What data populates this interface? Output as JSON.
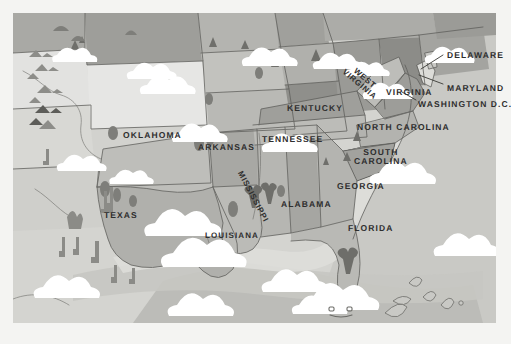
{
  "map": {
    "title": "Illustrated map of the Southeastern and South Central United States",
    "style": "grayscale flat illustration",
    "frame": {
      "x": 13,
      "y": 13,
      "width": 483,
      "height": 310
    },
    "colors": {
      "background": "#f4f4f2",
      "ocean": "#d9d9d6",
      "ocean_deep": "#c4c4c0",
      "shelf": "#cdcdc9",
      "land_light": "#e8e8e6",
      "land_mid": "#c3c3bf",
      "land_dark": "#9d9d99",
      "land_darker": "#8a8a86",
      "border": "#5e5e5a",
      "label": "#2e2e2e",
      "cloud": "#ffffff",
      "icon": "#7a7a76"
    },
    "state_labels": [
      {
        "name": "oklahoma",
        "text": "OKLAHOMA",
        "x": 123,
        "y": 131,
        "size": 8.5,
        "rotate": 0,
        "lines": [
          "OKLAHOMA"
        ]
      },
      {
        "name": "arkansas",
        "text": "ARKANSAS",
        "x": 198,
        "y": 143,
        "size": 8.5,
        "rotate": 0,
        "lines": [
          "ARKANSAS"
        ]
      },
      {
        "name": "texas",
        "text": "TEXAS",
        "x": 104,
        "y": 211,
        "size": 8.5,
        "rotate": 0,
        "lines": [
          "TEXAS"
        ]
      },
      {
        "name": "louisiana",
        "text": "LOUISIANA",
        "x": 205,
        "y": 232,
        "size": 8,
        "rotate": 0,
        "lines": [
          "LOUISIANA"
        ]
      },
      {
        "name": "mississippi",
        "text": "MISSISSIPPI",
        "x": 243,
        "y": 170,
        "size": 8,
        "rotate": 62,
        "lines": [
          "MISSISSIPPI"
        ]
      },
      {
        "name": "alabama",
        "text": "ALABAMA",
        "x": 281,
        "y": 200,
        "size": 8.5,
        "rotate": 0,
        "lines": [
          "ALABAMA"
        ]
      },
      {
        "name": "tennessee",
        "text": "TENNESSEE",
        "x": 262,
        "y": 135,
        "size": 8.5,
        "rotate": 0,
        "lines": [
          "TENNESSEE"
        ]
      },
      {
        "name": "kentucky",
        "text": "KENTUCKY",
        "x": 287,
        "y": 104,
        "size": 8.5,
        "rotate": 0,
        "lines": [
          "KENTUCKY"
        ]
      },
      {
        "name": "west-virginia",
        "text": "WEST VIRGINIA",
        "x": 351,
        "y": 62,
        "size": 8,
        "rotate": 40,
        "lines": [
          "WEST",
          "VIRGINIA"
        ]
      },
      {
        "name": "virginia",
        "text": "VIRGINIA",
        "x": 386,
        "y": 88,
        "size": 8.5,
        "rotate": 0,
        "lines": [
          "VIRGINIA"
        ]
      },
      {
        "name": "north-carolina",
        "text": "NORTH CAROLINA",
        "x": 357,
        "y": 123,
        "size": 8.5,
        "rotate": 0,
        "lines": [
          "NORTH CAROLINA"
        ]
      },
      {
        "name": "south-carolina",
        "text": "SOUTH CAROLINA",
        "x": 354,
        "y": 148,
        "size": 8.5,
        "rotate": 0,
        "lines": [
          "SOUTH",
          "CAROLINA"
        ]
      },
      {
        "name": "georgia",
        "text": "GEORGIA",
        "x": 337,
        "y": 182,
        "size": 8.5,
        "rotate": 0,
        "lines": [
          "GEORGIA"
        ]
      },
      {
        "name": "florida",
        "text": "FLORIDA",
        "x": 348,
        "y": 224,
        "size": 8.5,
        "rotate": 0,
        "lines": [
          "FLORIDA"
        ]
      },
      {
        "name": "delaware",
        "text": "DELAWARE",
        "x": 447,
        "y": 51,
        "size": 8.5,
        "rotate": 0,
        "lines": [
          "DELAWARE"
        ]
      },
      {
        "name": "maryland",
        "text": "MARYLAND",
        "x": 447,
        "y": 84,
        "size": 8.5,
        "rotate": 0,
        "lines": [
          "MARYLAND"
        ]
      },
      {
        "name": "washington-dc",
        "text": "WASHINGTON D.C.",
        "x": 418,
        "y": 100,
        "size": 8.5,
        "rotate": 0,
        "lines": [
          "WASHINGTON D.C."
        ]
      }
    ],
    "leader_lines": [
      {
        "name": "leader-delaware",
        "from": [
          443,
          55
        ],
        "to": [
          420,
          68
        ]
      },
      {
        "name": "leader-maryland",
        "from": [
          443,
          84
        ],
        "to": [
          418,
          75
        ]
      },
      {
        "name": "leader-washington-dc",
        "from": [
          416,
          100
        ],
        "to": [
          399,
          91
        ]
      }
    ],
    "decorations": {
      "clouds": 14,
      "cloud_with_face": 1,
      "cacti": 7,
      "mountains": 8,
      "trees": 6,
      "palms": 3,
      "islands": 6
    }
  }
}
